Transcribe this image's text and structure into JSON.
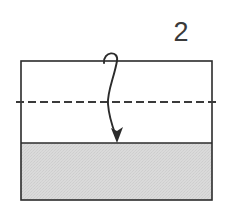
{
  "diagram": {
    "step_label": "2",
    "canvas": {
      "width": 230,
      "height": 218,
      "background": "#ffffff"
    },
    "paper": {
      "name": "paper-sheet",
      "x": 21,
      "y": 61,
      "width": 191,
      "height": 139,
      "fill": "#ffffff",
      "stroke": "#2b2b2b",
      "stroke_width": 1.6
    },
    "shaded_band": {
      "name": "shaded-bottom-band",
      "x": 21,
      "y": 143,
      "width": 191,
      "height": 57,
      "fill": "#d8d8d8",
      "stroke": "#2b2b2b",
      "stroke_width": 1.6,
      "texture": "fine-stipple"
    },
    "fold_line": {
      "name": "dashed-fold-line",
      "y": 102,
      "x_start": 16,
      "x_end": 218,
      "stroke": "#3a3a3a",
      "stroke_width": 2,
      "dash": "8 4",
      "style": "dashed"
    },
    "fold_arrow": {
      "name": "fold-direction-arrow",
      "stroke": "#2b2b2b",
      "stroke_width": 1.9,
      "hook_start_x": 104,
      "hook_peak_y": 53,
      "descend_x": 110,
      "tip_x": 117,
      "tip_y": 143,
      "head_width": 10,
      "head_length": 15,
      "direction": "down"
    }
  }
}
